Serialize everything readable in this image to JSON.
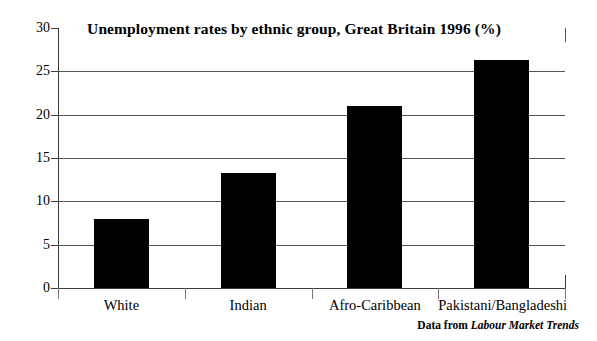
{
  "chart_data": {
    "type": "bar",
    "title": "Unemployment rates by ethnic group, Great Britain 1996 (%)",
    "xlabel": "",
    "ylabel": "",
    "ylim": [
      0,
      30
    ],
    "yticks": [
      0,
      5,
      10,
      15,
      20,
      25,
      30
    ],
    "ytick_labels": [
      "0",
      "5",
      "10",
      "15",
      "20",
      "25",
      "30"
    ],
    "grid": true,
    "legend": false,
    "bar_color": "#000000",
    "categories": [
      "White",
      "Indian",
      "Afro-Caribbean",
      "Pakistani/Bangladeshi"
    ],
    "values": [
      8.0,
      13.3,
      21.0,
      26.3
    ],
    "annotations": {
      "source_prefix": "Data from",
      "source_title": "Labour Market Trends"
    }
  }
}
